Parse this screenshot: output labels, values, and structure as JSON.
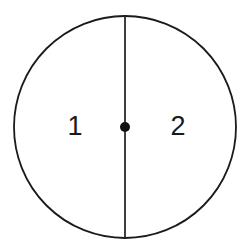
{
  "figure": {
    "kind": "geometry-diagram",
    "background_color": "#ffffff",
    "stroke_color": "#1a1a1a",
    "canvas": {
      "width": 249,
      "height": 251
    }
  },
  "circle": {
    "center_x": 125,
    "center_y": 127,
    "radius": 111,
    "stroke_width": 1.8,
    "fill": "none",
    "stroke_color": "#1a1a1a"
  },
  "diameter_line": {
    "orientation": "vertical",
    "x": 125,
    "y_start": 16,
    "y_end": 238,
    "stroke_width": 1.8,
    "stroke_color": "#2b2b2b"
  },
  "center_point": {
    "x": 125,
    "y": 127,
    "radius": 5,
    "fill": "#111111"
  },
  "labels": [
    {
      "text": "1",
      "x": 75,
      "y": 128,
      "region": "left-half"
    },
    {
      "text": "2",
      "x": 178,
      "y": 128,
      "region": "right-half"
    }
  ]
}
